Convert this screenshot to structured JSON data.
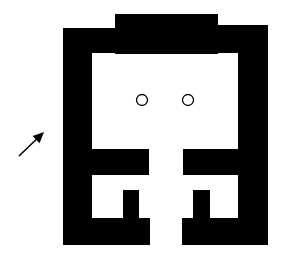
{
  "diagram": {
    "type": "floor-plan",
    "colors": {
      "wall": "#000000",
      "background": "#ffffff",
      "column_stroke": "#000000"
    },
    "walls": [
      {
        "name": "top-raised-wall",
        "x": 115,
        "y": 14,
        "w": 103,
        "h": 40
      },
      {
        "name": "top-left-wall",
        "x": 63,
        "y": 28,
        "w": 80,
        "h": 25
      },
      {
        "name": "top-right-wall",
        "x": 186,
        "y": 25,
        "w": 81,
        "h": 28
      },
      {
        "name": "left-outer-wall",
        "x": 63,
        "y": 28,
        "w": 29,
        "h": 217
      },
      {
        "name": "right-outer-wall",
        "x": 238,
        "y": 25,
        "w": 30,
        "h": 220
      },
      {
        "name": "left-cross-wall",
        "x": 91,
        "y": 149,
        "w": 58,
        "h": 26
      },
      {
        "name": "right-cross-wall",
        "x": 183,
        "y": 149,
        "w": 56,
        "h": 26
      },
      {
        "name": "left-stub-wall",
        "x": 123,
        "y": 190,
        "w": 16,
        "h": 30
      },
      {
        "name": "right-stub-wall",
        "x": 193,
        "y": 190,
        "w": 17,
        "h": 30
      },
      {
        "name": "bottom-left-wall",
        "x": 63,
        "y": 218,
        "w": 87,
        "h": 27
      },
      {
        "name": "bottom-right-wall",
        "x": 182,
        "y": 218,
        "w": 86,
        "h": 27
      }
    ],
    "columns": [
      {
        "name": "column-left",
        "cx": 142,
        "cy": 100,
        "r": 5.5
      },
      {
        "name": "column-right",
        "cx": 188,
        "cy": 100,
        "r": 5.5
      }
    ],
    "arrow": {
      "x1": 19,
      "y1": 156,
      "x2": 44,
      "y2": 132,
      "label": "entrance-direction"
    }
  }
}
